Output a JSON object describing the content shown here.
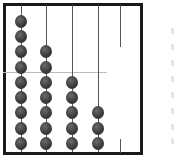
{
  "abacus": {
    "rods": [
      {
        "x": 21,
        "beads": 9
      },
      {
        "x": 46,
        "beads": 7
      },
      {
        "x": 72,
        "beads": 5
      },
      {
        "x": 98,
        "beads": 3
      },
      {
        "x": 120,
        "beads": 0
      }
    ],
    "bead_color": "#3c3c3c",
    "frame_color": "#1a1a1a",
    "divider_line_y": 72
  }
}
